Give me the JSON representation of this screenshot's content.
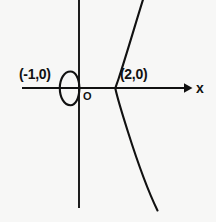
{
  "figure": {
    "kind": "coordinate-graph",
    "background_color": "#f7f7f6",
    "stroke_color": "#111111",
    "width": 216,
    "height": 222
  },
  "axes": {
    "x_axis": {
      "label": "x",
      "has_arrow": true,
      "arrow_direction": "right",
      "y_pixel": 88,
      "x_start_pixel": 22,
      "x_end_pixel": 190
    },
    "y_axis": {
      "label": "",
      "has_arrow": false,
      "x_pixel": 79,
      "y_start_pixel": 0,
      "y_end_pixel": 208
    },
    "origin_label": "O"
  },
  "labels": {
    "point_left": "(-1,0)",
    "point_right": "(2,0)",
    "origin": "O",
    "x_axis": "x"
  },
  "chart_data": {
    "type": "line",
    "title": "",
    "xlabel": "x",
    "ylabel": "",
    "grid": false,
    "legend": null,
    "annotations": [
      {
        "text": "(-1,0)",
        "x": -1,
        "y": 0
      },
      {
        "text": "(2,0)",
        "x": 2,
        "y": 0
      },
      {
        "text": "O",
        "x": 0,
        "y": 0
      }
    ],
    "x_intercepts": [
      -1,
      0,
      2
    ],
    "series": [
      {
        "name": "oval-loop",
        "closed": true,
        "x_range": [
          -1.0,
          0.0
        ],
        "points": [
          {
            "x": -1.0,
            "y": 0.0
          },
          {
            "x": -0.85,
            "y": 0.42
          },
          {
            "x": -0.5,
            "y": 0.58
          },
          {
            "x": -0.15,
            "y": 0.42
          },
          {
            "x": 0.0,
            "y": 0.0
          },
          {
            "x": -0.15,
            "y": -0.42
          },
          {
            "x": -0.5,
            "y": -0.58
          },
          {
            "x": -0.85,
            "y": -0.42
          },
          {
            "x": -1.0,
            "y": 0.0
          }
        ]
      },
      {
        "name": "open-branch",
        "closed": false,
        "x_range": [
          2.0,
          3.3
        ],
        "points": [
          {
            "x": 3.25,
            "y": 3.1
          },
          {
            "x": 2.55,
            "y": 1.55
          },
          {
            "x": 2.12,
            "y": 0.52
          },
          {
            "x": 2.0,
            "y": 0.0
          },
          {
            "x": 2.1,
            "y": -0.7
          },
          {
            "x": 2.7,
            "y": -2.1
          },
          {
            "x": 3.6,
            "y": -3.4
          }
        ]
      }
    ]
  }
}
